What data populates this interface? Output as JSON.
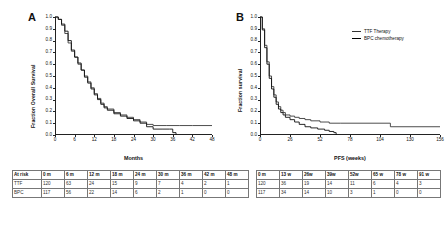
{
  "figure": {
    "panelA": {
      "letter": "A",
      "ylabel": "Fraction Overall Survival",
      "xlabel": "Months",
      "yticks": [
        "1.0",
        "0.9",
        "0.8",
        "0.7",
        "0.6",
        "0.5",
        "0.4",
        "0.3",
        "0.2",
        "0.1",
        "0.0"
      ],
      "xticks": [
        "0",
        "6",
        "12",
        "18",
        "24",
        "30",
        "36",
        "42",
        "48"
      ],
      "risk_table": {
        "header": [
          "At risk",
          "0 m",
          "6 m",
          "12 m",
          "18 m",
          "24 m",
          "30 m",
          "36 m",
          "42 m",
          "48 m"
        ],
        "rows": [
          [
            "TTF",
            "120",
            "63",
            "24",
            "15",
            "9",
            "7",
            "4",
            "2",
            "1"
          ],
          [
            "BPC",
            "117",
            "56",
            "22",
            "14",
            "6",
            "2",
            "1",
            "0",
            "0"
          ]
        ]
      },
      "chart_data": {
        "type": "line",
        "title": "A",
        "xlabel": "Months",
        "ylabel": "Fraction Overall Survival",
        "xlim": [
          0,
          48
        ],
        "ylim": [
          0,
          1.0
        ],
        "grid": false,
        "legend": null,
        "series": [
          {
            "name": "TTF Therapy",
            "x": [
              0,
              1,
              2,
              3,
              4,
              5,
              6,
              7,
              8,
              9,
              10,
              11,
              12,
              13,
              14,
              15,
              16,
              18,
              20,
              22,
              24,
              26,
              28,
              30,
              34,
              38,
              42,
              48
            ],
            "y": [
              1.0,
              0.98,
              0.93,
              0.86,
              0.78,
              0.71,
              0.66,
              0.6,
              0.55,
              0.5,
              0.45,
              0.4,
              0.35,
              0.31,
              0.27,
              0.24,
              0.22,
              0.19,
              0.17,
              0.15,
              0.13,
              0.11,
              0.09,
              0.08,
              0.08,
              0.08,
              0.08,
              0.08
            ]
          },
          {
            "name": "BPC chemotherapy",
            "x": [
              0,
              1,
              2,
              3,
              4,
              5,
              6,
              7,
              8,
              9,
              10,
              11,
              12,
              13,
              14,
              15,
              16,
              18,
              20,
              22,
              24,
              26,
              28,
              30,
              33,
              35,
              36,
              37
            ],
            "y": [
              1.0,
              0.98,
              0.94,
              0.88,
              0.8,
              0.72,
              0.66,
              0.61,
              0.55,
              0.49,
              0.44,
              0.39,
              0.34,
              0.3,
              0.26,
              0.23,
              0.21,
              0.18,
              0.16,
              0.14,
              0.12,
              0.1,
              0.07,
              0.05,
              0.05,
              0.05,
              0.02,
              0.0
            ]
          }
        ]
      }
    },
    "panelB": {
      "letter": "B",
      "ylabel": "Fraction survival",
      "xlabel": "PFS (weeks)",
      "yticks": [
        "1.0",
        "0.9",
        "0.8",
        "0.7",
        "0.6",
        "0.5",
        "0.4",
        "0.3",
        "0.2",
        "0.1",
        "0.0"
      ],
      "xticks": [
        "0",
        "26",
        "52",
        "78",
        "104",
        "130",
        "156"
      ],
      "legend": [
        {
          "label": "TTF Therapy"
        },
        {
          "label": "BPC chemotherapy"
        }
      ],
      "risk_table": {
        "header": [
          "0 m",
          "13 w",
          "26w",
          "39w",
          "52w",
          "65 w",
          "78 w",
          "91 w"
        ],
        "rows": [
          [
            "120",
            "36",
            "19",
            "14",
            "11",
            "6",
            "4",
            "3"
          ],
          [
            "117",
            "34",
            "14",
            "10",
            "3",
            "1",
            "0",
            "0"
          ]
        ]
      },
      "chart_data": {
        "type": "line",
        "title": "B",
        "xlabel": "PFS (weeks)",
        "ylabel": "Fraction survival",
        "xlim": [
          0,
          156
        ],
        "ylim": [
          0,
          1.0
        ],
        "grid": false,
        "legend_position": "top-right",
        "series": [
          {
            "name": "TTF Therapy",
            "x": [
              0,
              2,
              4,
              6,
              8,
              10,
              12,
              14,
              16,
              18,
              20,
              22,
              26,
              30,
              34,
              39,
              44,
              52,
              60,
              70,
              78,
              91,
              104,
              113,
              130,
              156
            ],
            "y": [
              1.0,
              0.9,
              0.76,
              0.62,
              0.5,
              0.41,
              0.34,
              0.28,
              0.24,
              0.21,
              0.19,
              0.17,
              0.16,
              0.15,
              0.14,
              0.13,
              0.12,
              0.11,
              0.1,
              0.1,
              0.1,
              0.1,
              0.1,
              0.07,
              0.07,
              0.07
            ]
          },
          {
            "name": "BPC chemotherapy",
            "x": [
              0,
              2,
              4,
              6,
              8,
              10,
              12,
              14,
              16,
              18,
              20,
              22,
              26,
              30,
              34,
              39,
              44,
              50,
              56,
              60,
              64,
              66
            ],
            "y": [
              1.0,
              0.89,
              0.74,
              0.6,
              0.48,
              0.39,
              0.32,
              0.26,
              0.22,
              0.19,
              0.17,
              0.15,
              0.13,
              0.11,
              0.09,
              0.07,
              0.06,
              0.05,
              0.04,
              0.03,
              0.02,
              0.0
            ]
          }
        ]
      }
    }
  },
  "colors": {
    "axis": "#222222",
    "curve_ttf": "#3a3a3a",
    "curve_bpc": "#111111",
    "table_border": "#777777"
  }
}
